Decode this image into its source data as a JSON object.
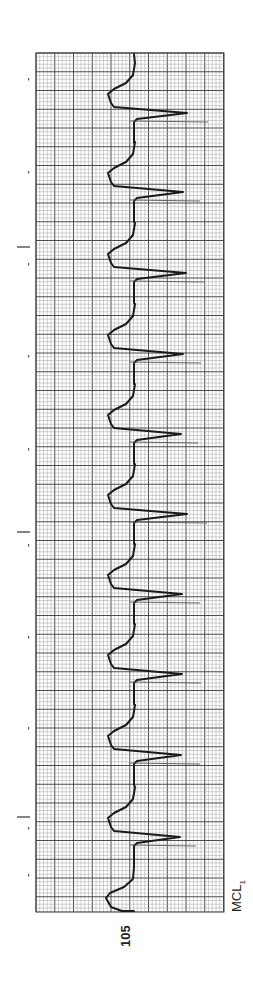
{
  "strip": {
    "lead": "MCL",
    "lead_subscript": "1",
    "strip_number": "105"
  },
  "chart_data": {
    "type": "line",
    "xlabel": "Time (runs top to bottom)",
    "ylabel": "Amplitude",
    "grid": true,
    "grid_box": {
      "left": 36,
      "top": 53,
      "right": 224,
      "bottom": 912
    },
    "minor_grid_px": 3.75,
    "major_grid_px": 18.8,
    "baseline_x": 134,
    "qrs_count": 10,
    "complexes": [
      {
        "peak_y": 113,
        "peak_x": 187,
        "spike_x": 208
      },
      {
        "peak_y": 192,
        "peak_x": 183,
        "spike_x": 200
      },
      {
        "peak_y": 273,
        "peak_x": 186,
        "spike_x": 204
      },
      {
        "peak_y": 354,
        "peak_x": 183,
        "spike_x": 201
      },
      {
        "peak_y": 434,
        "peak_x": 181,
        "spike_x": 198
      },
      {
        "peak_y": 514,
        "peak_x": 187,
        "spike_x": 207
      },
      {
        "peak_y": 594,
        "peak_x": 182,
        "spike_x": 200
      },
      {
        "peak_y": 674,
        "peak_x": 182,
        "spike_x": 201
      },
      {
        "peak_y": 755,
        "peak_x": 181,
        "spike_x": 200
      },
      {
        "peak_y": 837,
        "peak_x": 180,
        "spike_x": 196
      }
    ],
    "time_marks_y": [
      247,
      532,
      817
    ],
    "margin_dots_y": [
      78,
      171,
      263,
      355,
      448,
      544,
      636,
      727,
      827,
      874
    ]
  },
  "colors": {
    "paper": "#ffffff",
    "grid_minor": "#9a9a9a",
    "grid_major": "#3a3a3a",
    "trace": "#1a1a1a",
    "spike": "#555555"
  }
}
